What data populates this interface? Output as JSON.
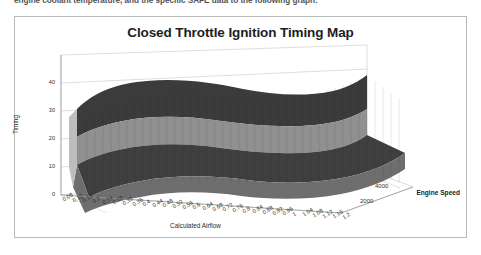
{
  "document": {
    "cutoff_line": "engine coolant temperature, and the specific SAFE data to the following graph:"
  },
  "chart_frame": {
    "border_color": "#b9b9b9"
  },
  "chart_data": {
    "type": "surface",
    "title": "Closed Throttle Ignition Timing Map",
    "xlabel": "Calculated Airflow",
    "ylabel": "Timing",
    "zlabel": "Engine Speed",
    "ylim": [
      0,
      45
    ],
    "y_ticks": [
      "0",
      "10",
      "20",
      "30",
      "40"
    ],
    "zlim": [
      0,
      5000
    ],
    "z_ticks": [
      "2000",
      "4000"
    ],
    "x_ticks": [
      "0.08",
      "0.12",
      "0.16",
      "0.2",
      "0.24",
      "0.28",
      "0.32",
      "0.36",
      "0.4",
      "0.44",
      "0.48",
      "0.52",
      "0.56",
      "0.6",
      "0.64",
      "0.68",
      "0.72",
      "0.76",
      "0.8",
      "0.84",
      "0.88",
      "0.92",
      "0.96",
      "1",
      "1.04",
      "1.08",
      "1.12",
      "1.16",
      "1.2"
    ],
    "grid": true,
    "legend_position": "none",
    "band_colors": {
      "top_dark": "#3a3a3a",
      "mid_gray": "#8f8f8f",
      "low_dark": "#3f3f3f",
      "base_gray": "#6e6e6e",
      "edge_light": "#c9c9c9"
    },
    "series": [
      {
        "name": "Engine Speed 0",
        "z": 0,
        "values": [
          22,
          22,
          22,
          21,
          21,
          21,
          20,
          20,
          20,
          20,
          19,
          19,
          19,
          19,
          18,
          18,
          18,
          18,
          17,
          17,
          17,
          16,
          16,
          16,
          15,
          15,
          15,
          14,
          14
        ]
      },
      {
        "name": "Engine Speed 1000",
        "z": 1000,
        "values": [
          26,
          26,
          25,
          25,
          25,
          24,
          24,
          24,
          23,
          23,
          23,
          22,
          22,
          22,
          21,
          21,
          21,
          20,
          20,
          20,
          19,
          19,
          18,
          18,
          18,
          17,
          17,
          16,
          16
        ]
      },
      {
        "name": "Engine Speed 2000",
        "z": 2000,
        "values": [
          32,
          32,
          31,
          31,
          31,
          30,
          30,
          30,
          29,
          29,
          29,
          28,
          28,
          28,
          27,
          27,
          26,
          26,
          25,
          25,
          24,
          24,
          23,
          23,
          22,
          22,
          21,
          21,
          20
        ]
      },
      {
        "name": "Engine Speed 3000",
        "z": 3000,
        "values": [
          38,
          38,
          37,
          37,
          37,
          36,
          36,
          36,
          35,
          35,
          35,
          34,
          34,
          33,
          33,
          32,
          32,
          31,
          31,
          30,
          30,
          29,
          28,
          28,
          27,
          26,
          26,
          25,
          24
        ]
      },
      {
        "name": "Engine Speed 4000",
        "z": 4000,
        "values": [
          42,
          42,
          42,
          41,
          41,
          41,
          41,
          40,
          40,
          40,
          40,
          39,
          39,
          39,
          38,
          38,
          37,
          37,
          36,
          35,
          35,
          34,
          33,
          32,
          31,
          30,
          29,
          28,
          27
        ]
      },
      {
        "name": "Engine Speed 5000",
        "z": 5000,
        "values": [
          44,
          44,
          44,
          44,
          43,
          43,
          43,
          43,
          42,
          42,
          42,
          42,
          41,
          41,
          40,
          40,
          39,
          38,
          37,
          36,
          35,
          34,
          33,
          32,
          31,
          30,
          29,
          28,
          27
        ]
      }
    ]
  }
}
